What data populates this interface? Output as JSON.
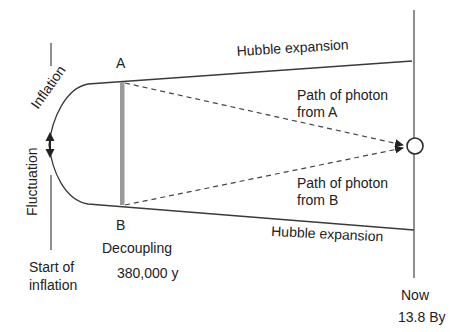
{
  "diagram": {
    "colors": {
      "line": "#3a3a3a",
      "decoupling_bar": "#9a9a9a",
      "text": "#222222",
      "background": "#ffffff"
    },
    "labels": {
      "point_a": "A",
      "point_b": "B",
      "hubble_top": "Hubble expansion",
      "hubble_bottom": "Hubble expansion",
      "photon_a_line1": "Path of photon",
      "photon_a_line2": "from A",
      "photon_b_line1": "Path of photon",
      "photon_b_line2": "from B",
      "inflation": "Inflation",
      "fluctuation": "Fluctuation",
      "start_line1": "Start of",
      "start_line2": "inflation",
      "decoupling": "Decoupling",
      "decoupling_time": "380,000 y",
      "now": "Now",
      "now_time": "13.8 By"
    },
    "elements": {
      "observer": "observer-circle",
      "fluctuation_arrow": "double-arrow-icon",
      "decoupling_surface": "grey-bar"
    }
  }
}
